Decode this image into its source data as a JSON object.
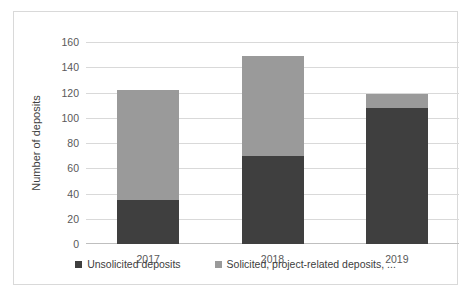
{
  "chart_data": {
    "type": "bar",
    "subtype": "stacked-column",
    "title": "",
    "xlabel": "",
    "ylabel": "Number of deposits",
    "categories": [
      "2017",
      "2018",
      "2019"
    ],
    "series": [
      {
        "name": "Unsolicited deposits",
        "color": "#3f3f3f",
        "values": [
          35,
          70,
          108
        ]
      },
      {
        "name": "Solicited, project-related deposits, ...",
        "color": "#9a9a9a",
        "values": [
          87,
          79,
          11
        ]
      }
    ],
    "totals": [
      122,
      149,
      119
    ],
    "ylim": [
      0,
      160
    ],
    "ytick_values": [
      0,
      20,
      40,
      60,
      80,
      100,
      120,
      140,
      160
    ],
    "ytick_labels": [
      "0",
      "20",
      "40",
      "60",
      "80",
      "100",
      "120",
      "140",
      "160"
    ],
    "grid": true,
    "legend_position": "bottom"
  },
  "axis": {
    "y_title": "Number of deposits"
  },
  "legend": {
    "items": [
      {
        "label": "Unsolicited deposits",
        "color": "#3f3f3f"
      },
      {
        "label": "Solicited, project-related deposits, ...",
        "color": "#9a9a9a"
      }
    ]
  },
  "colors": {
    "unsolicited": "#3f3f3f",
    "solicited": "#9a9a9a",
    "gridline": "#d9d9d9",
    "border": "#d9d9d9",
    "tick_text": "#595959"
  }
}
